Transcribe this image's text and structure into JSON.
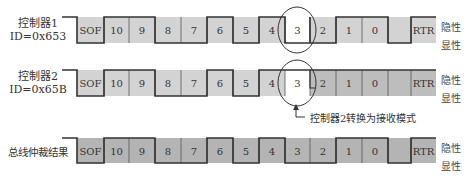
{
  "rows": [
    {
      "label_line1": "控制器1",
      "label_line2": "ID=0x653",
      "levels": [
        0,
        1,
        1,
        0,
        0,
        1,
        0,
        1,
        0,
        0,
        1,
        1,
        0,
        1
      ],
      "fill": "#d3d3d3"
    },
    {
      "label_line1": "控制器2",
      "label_line2": "ID=0x65B",
      "levels": [
        0,
        1,
        1,
        0,
        0,
        1,
        0,
        1,
        1,
        1,
        1,
        1,
        1,
        1
      ],
      "fill": "#d3d3d3",
      "receive_fill": "#bdbdbd"
    },
    {
      "label_line1": "总线仲裁结果",
      "label_line2": "",
      "levels": [
        0,
        1,
        1,
        0,
        0,
        1,
        0,
        1,
        0,
        0,
        1,
        1,
        0,
        1
      ],
      "fill": "#b4b4b4"
    }
  ],
  "cells": [
    "SOF",
    "10",
    "9",
    "8",
    "7",
    "6",
    "5",
    "4",
    "3",
    "2",
    "1",
    "0",
    "",
    "RTR"
  ],
  "recessive_label": "隐性",
  "dominant_label": "显性",
  "annotation": "控制器2转换为接收模式",
  "highlight_cell": "3",
  "colors": {
    "line": "#333333",
    "highlight": "#ffffff"
  }
}
